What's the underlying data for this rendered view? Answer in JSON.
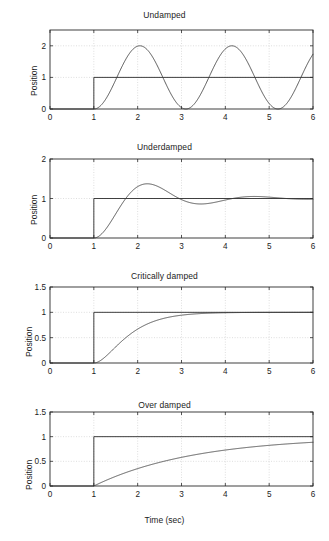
{
  "figure": {
    "width": 329,
    "height": 541,
    "background": "#ffffff",
    "axis_color": "#2b2b2b",
    "grid_color": "#c8c8c8",
    "curve_color": "#3a3a3a",
    "step_color": "#2b2b2b",
    "xlabel": "Time (sec)"
  },
  "chart_data": [
    {
      "type": "line",
      "title": "Undamped",
      "xlabel": "",
      "ylabel": "Position",
      "xlim": [
        0,
        6
      ],
      "ylim": [
        0,
        2.5
      ],
      "xticks": [
        0,
        1,
        2,
        3,
        4,
        5,
        6
      ],
      "xticklabels": [
        "0",
        "1",
        "2",
        "3",
        "4",
        "5",
        "6"
      ],
      "yticks": [
        0,
        1,
        2
      ],
      "yticklabels": [
        "0",
        "1",
        "2"
      ],
      "grid": true,
      "legend": "none",
      "series": [
        {
          "name": "step input",
          "comment": "unit step at t = 1 s",
          "x": [
            0,
            1,
            1,
            6
          ],
          "y": [
            0,
            0,
            1,
            1
          ]
        },
        {
          "name": "response",
          "comment": "x(t) = 1 - cos(w*(t-1)), w = 2*pi/2.1, no damping",
          "omega": 2.992,
          "zeta": 0.0,
          "t_start": 1,
          "steady_state": 1,
          "peak_value": 2,
          "peak_times": [
            2.05,
            4.15
          ],
          "trough_value": 0,
          "trough_times": [
            3.1,
            5.2
          ],
          "value_at_6": 1.72
        }
      ]
    },
    {
      "type": "line",
      "title": "Underdamped",
      "xlabel": "",
      "ylabel": "Position",
      "xlim": [
        0,
        6
      ],
      "ylim": [
        0,
        2
      ],
      "xticks": [
        0,
        1,
        2,
        3,
        4,
        5,
        6
      ],
      "xticklabels": [
        "0",
        "1",
        "2",
        "3",
        "4",
        "5",
        "6"
      ],
      "yticks": [
        0,
        1,
        2
      ],
      "yticklabels": [
        "0",
        "1",
        "2"
      ],
      "grid": true,
      "legend": "none",
      "series": [
        {
          "name": "step input",
          "x": [
            0,
            1,
            1,
            6
          ],
          "y": [
            0,
            0,
            1,
            1
          ]
        },
        {
          "name": "response",
          "comment": "second order underdamped step response",
          "omega": 2.7,
          "zeta": 0.3,
          "t_start": 1,
          "steady_state": 1,
          "overshoot_value": 1.33,
          "overshoot_time": 2.12,
          "undershoot_value": 0.92,
          "undershoot_time": 3.2,
          "second_peak_value": 1.03,
          "second_peak_time": 4.3,
          "value_at_6": 1.0
        }
      ]
    },
    {
      "type": "line",
      "title": "Critically damped",
      "xlabel": "",
      "ylabel": "Position",
      "xlim": [
        0,
        6
      ],
      "ylim": [
        0,
        1.5
      ],
      "xticks": [
        0,
        1,
        2,
        3,
        4,
        5,
        6
      ],
      "xticklabels": [
        "0",
        "1",
        "2",
        "3",
        "4",
        "5",
        "6"
      ],
      "yticks": [
        0,
        0.5,
        1,
        1.5
      ],
      "yticklabels": [
        "0",
        "0.5",
        "1",
        "1.5"
      ],
      "grid": true,
      "legend": "none",
      "series": [
        {
          "name": "step input",
          "x": [
            0,
            1,
            1,
            6
          ],
          "y": [
            0,
            0,
            1,
            1
          ]
        },
        {
          "name": "response",
          "comment": "critically damped: 1 - (1 + w*(t-1))*exp(-w*(t-1))",
          "omega": 2.3,
          "zeta": 1.0,
          "t_start": 1,
          "steady_state": 1,
          "value_at_1_5": 0.32,
          "value_at_2": 0.69,
          "value_at_2_5": 0.88,
          "value_at_3": 0.96,
          "value_at_6": 1.0
        }
      ]
    },
    {
      "type": "line",
      "title": "Over damped",
      "xlabel": "Time (sec)",
      "ylabel": "Position",
      "xlim": [
        0,
        6
      ],
      "ylim": [
        0,
        1.5
      ],
      "xticks": [
        0,
        1,
        2,
        3,
        4,
        5,
        6
      ],
      "xticklabels": [
        "0",
        "1",
        "2",
        "3",
        "4",
        "5",
        "6"
      ],
      "yticks": [
        0,
        0.5,
        1,
        1.5
      ],
      "yticklabels": [
        "0",
        "0.5",
        "1",
        "1.5"
      ],
      "grid": true,
      "legend": "none",
      "series": [
        {
          "name": "step input",
          "x": [
            0,
            1,
            1,
            6
          ],
          "y": [
            0,
            0,
            1,
            1
          ]
        },
        {
          "name": "response",
          "comment": "over damped first-order-like rise: 1 - exp(-(t-1)/tau), tau = 2.3",
          "tau": 2.3,
          "zeta": 2.5,
          "t_start": 1,
          "steady_state": 1,
          "value_at_2": 0.35,
          "value_at_3": 0.58,
          "value_at_4": 0.72,
          "value_at_5": 0.82,
          "value_at_6": 0.885
        }
      ]
    }
  ],
  "panels": [
    {
      "title": "Undamped",
      "ylabel": "Position",
      "yticklabels": [
        "0",
        "1",
        "2"
      ],
      "xticklabels": [
        "0",
        "1",
        "2",
        "3",
        "4",
        "5",
        "6"
      ]
    },
    {
      "title": "Underdamped",
      "ylabel": "Position",
      "yticklabels": [
        "0",
        "1",
        "2"
      ],
      "xticklabels": [
        "0",
        "1",
        "2",
        "3",
        "4",
        "5",
        "6"
      ]
    },
    {
      "title": "Critically damped",
      "ylabel": "Position",
      "yticklabels": [
        "0",
        "0.5",
        "1",
        "1.5"
      ],
      "xticklabels": [
        "0",
        "1",
        "2",
        "3",
        "4",
        "5",
        "6"
      ]
    },
    {
      "title": "Over damped",
      "ylabel": "Position",
      "yticklabels": [
        "0",
        "0.5",
        "1",
        "1.5"
      ],
      "xticklabels": [
        "0",
        "1",
        "2",
        "3",
        "4",
        "5",
        "6"
      ]
    }
  ]
}
